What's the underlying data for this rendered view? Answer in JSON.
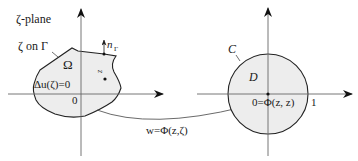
{
  "left_panel": {
    "plane_label": "ζ-plane",
    "boundary_label": "ζ on Γ",
    "region_label": "Ω",
    "equation_label": "Δu(ζ)=0",
    "origin_label": "0",
    "normal_label_main": "n",
    "normal_label_sub": "Γ",
    "point_label": "z"
  },
  "right_panel": {
    "circle_label": "C",
    "disk_label": "D",
    "center_label": "0=Φ(z, z)",
    "unit_label": "1"
  },
  "mapping": {
    "label": "w=Φ(z,ζ)"
  },
  "colors": {
    "stroke": "#222222",
    "region_fill": "#ececec",
    "axis": "#555555"
  }
}
